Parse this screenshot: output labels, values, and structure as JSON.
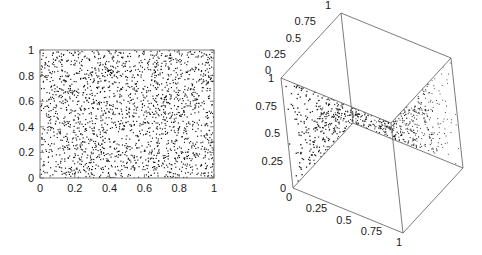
{
  "figure": {
    "title": "",
    "background_color": "#ffffff",
    "width": 482,
    "height": 255
  },
  "panels": {
    "left": {
      "name": "2d-uniform-scatter",
      "x_ticks": [
        "0",
        "0.2",
        "0.4",
        "0.6",
        "0.8",
        "1"
      ],
      "y_ticks": [
        "0",
        "0.2",
        "0.4",
        "0.6",
        "0.8",
        "1"
      ]
    },
    "right": {
      "name": "3d-uniform-scatter",
      "axis_top_ticks": [
        "0",
        "0.25",
        "0.5",
        "0.75",
        "1"
      ],
      "axis_left_ticks": [
        "1",
        "0.75",
        "0.5",
        "0.25",
        "0"
      ],
      "axis_bottom_ticks": [
        "0",
        "0.25",
        "0.5",
        "0.75",
        "1"
      ]
    }
  },
  "chart_data": [
    {
      "type": "scatter",
      "title": "",
      "xlabel": "",
      "ylabel": "",
      "xlim": [
        0,
        1
      ],
      "ylim": [
        0,
        1
      ],
      "xticks": [
        0,
        0.2,
        0.4,
        0.6,
        0.8,
        1
      ],
      "yticks": [
        0,
        0.2,
        0.4,
        0.6,
        0.8,
        1
      ],
      "grid": false,
      "legend": null,
      "n_points": 2000,
      "distribution": "uniform random in unit square",
      "marker": {
        "shape": "point",
        "size": 1,
        "color": "#111111"
      },
      "description": "Dense uniform random point cloud filling the unit square, framed by a thin grey rectangle with outward tick marks."
    },
    {
      "type": "scatter",
      "dimensions": 3,
      "title": "",
      "xlabel": "",
      "ylabel": "",
      "zlabel": "",
      "xlim": [
        0,
        1
      ],
      "ylim": [
        0,
        1
      ],
      "zlim": [
        0,
        1
      ],
      "xticks": [
        0,
        0.25,
        0.5,
        0.75,
        1
      ],
      "yticks": [
        0,
        0.25,
        0.5,
        0.75,
        1
      ],
      "zticks": [
        0,
        0.25,
        0.5,
        0.75,
        1
      ],
      "grid": false,
      "legend": null,
      "n_points": 2000,
      "distribution": "uniform random in unit cube",
      "marker": {
        "shape": "point",
        "size": 1,
        "color": "#222222"
      },
      "description": "Dense uniform random point cloud inside a wireframe unit cube drawn in perspective with labelled edges."
    }
  ]
}
